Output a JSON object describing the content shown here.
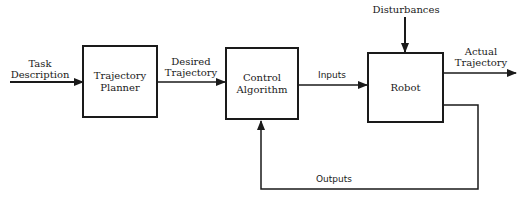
{
  "diagram": {
    "type": "block-diagram",
    "title": "",
    "blocks": [
      {
        "id": "trajectory-planner",
        "label": "Trajectory\nPlanner"
      },
      {
        "id": "control-algorithm",
        "label": "Control\nAlgorithm"
      },
      {
        "id": "robot",
        "label": "Robot"
      }
    ],
    "signals": {
      "task_description": "Task\nDescription",
      "desired_trajectory": "Desired\nTrajectory",
      "inputs": "Inputs",
      "disturbances": "Disturbances",
      "actual_trajectory": "Actual\nTrajectory",
      "outputs": "Outputs"
    },
    "edges": [
      {
        "from": "external",
        "to": "trajectory-planner",
        "label": "Task Description"
      },
      {
        "from": "trajectory-planner",
        "to": "control-algorithm",
        "label": "Desired Trajectory"
      },
      {
        "from": "control-algorithm",
        "to": "robot",
        "label": "Inputs"
      },
      {
        "from": "external",
        "to": "robot",
        "label": "Disturbances"
      },
      {
        "from": "robot",
        "to": "external",
        "label": "Actual Trajectory"
      },
      {
        "from": "robot",
        "to": "control-algorithm",
        "label": "Outputs",
        "kind": "feedback"
      }
    ],
    "colors": {
      "stroke": "#1a1a1a",
      "background": "#ffffff"
    }
  }
}
